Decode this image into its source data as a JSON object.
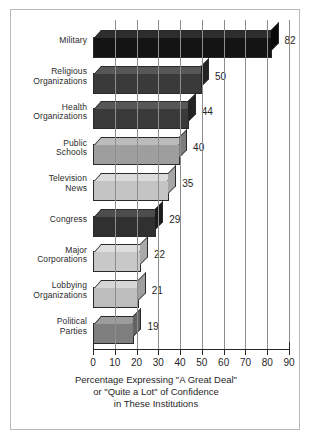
{
  "chart_data": {
    "type": "bar",
    "orientation": "horizontal",
    "title": "",
    "xlabel": "Percentage Expressing \"A Great Deal\" or \"Quite a Lot\" of Confidence in These Institutions",
    "ylabel": "",
    "xlim": [
      0,
      90
    ],
    "xticks": [
      "0",
      "10",
      "20",
      "30",
      "40",
      "50",
      "60",
      "70",
      "80",
      "90"
    ],
    "grid": true,
    "legend": "none",
    "categories": [
      "Military",
      "Religious Organizations",
      "Health Organizations",
      "Public Schools",
      "Television News",
      "Congress",
      "Major Corporations",
      "Lobbying Organizations",
      "Political Parties"
    ],
    "values": [
      82,
      50,
      44,
      40,
      35,
      29,
      22,
      21,
      19
    ],
    "bars": [
      {
        "label_line1": "Military",
        "label_line2": "",
        "value": 82,
        "value_text": "82",
        "fill": "#141414",
        "top": "#2e2e2e",
        "side": "#0a0a0a"
      },
      {
        "label_line1": "Religious",
        "label_line2": "Organizations",
        "value": 50,
        "value_text": "50",
        "fill": "#3a3a3a",
        "top": "#575757",
        "side": "#232323"
      },
      {
        "label_line1": "Health",
        "label_line2": "Organizations",
        "value": 44,
        "value_text": "44",
        "fill": "#3a3a3a",
        "top": "#575757",
        "side": "#232323"
      },
      {
        "label_line1": "Public",
        "label_line2": "Schools",
        "value": 40,
        "value_text": "40",
        "fill": "#9e9e9e",
        "top": "#bcbcbc",
        "side": "#7d7d7d"
      },
      {
        "label_line1": "Television",
        "label_line2": "News",
        "value": 35,
        "value_text": "35",
        "fill": "#c4c4c4",
        "top": "#dcdcdc",
        "side": "#a6a6a6"
      },
      {
        "label_line1": "Congress",
        "label_line2": "",
        "value": 29,
        "value_text": "29",
        "fill": "#303030",
        "top": "#4d4d4d",
        "side": "#1c1c1c"
      },
      {
        "label_line1": "Major",
        "label_line2": "Corporations",
        "value": 22,
        "value_text": "22",
        "fill": "#c8c8c8",
        "top": "#dedede",
        "side": "#a9a9a9"
      },
      {
        "label_line1": "Lobbying",
        "label_line2": "Organizations",
        "value": 21,
        "value_text": "21",
        "fill": "#bdbdbd",
        "top": "#d6d6d6",
        "side": "#9e9e9e"
      },
      {
        "label_line1": "Political",
        "label_line2": "Parties",
        "value": 19,
        "value_text": "19",
        "fill": "#7e7e7e",
        "top": "#9c9c9c",
        "side": "#636363"
      }
    ],
    "caption_lines": [
      "Percentage Expressing \"A Great Deal\"",
      "or \"Quite a Lot\" of Confidence",
      "in These Institutions"
    ],
    "colors": {
      "frame": "#b9b9b9",
      "gridline": "#8d8d8d",
      "axis": "#262626",
      "text": "#1f1f1f",
      "background": "#ffffff"
    }
  }
}
